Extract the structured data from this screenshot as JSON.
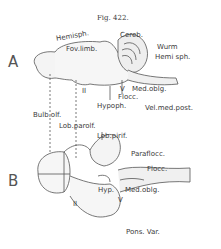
{
  "figure": {
    "title": "Fig. 422.",
    "panels": [
      {
        "letter": "A",
        "labels": {
          "hemisph": "Hemisph.",
          "cereb": "Cereb.",
          "wurm": "Wurm",
          "hemisph_cereb": "Hemi sph.",
          "fov_limb": "Fov.limb.",
          "roman_two": "II",
          "roman_five": "V",
          "med_oblg": "Med.oblg.",
          "flocc": "Flocc.",
          "hypoph": "Hypoph.",
          "vel_med_post": "Vel.med.post."
        }
      },
      {
        "letter": "B",
        "labels": {
          "bulb_olf": "Bulb.olf.",
          "lob_parolf": "Lob.parolf.",
          "lob_pirif": "Lob.pirif.",
          "paraflocc": "Paraflocc.",
          "flocc": "Flocc.",
          "hyp": "Hyp.",
          "med_oblg": "Med.oblg.",
          "roman_two": "II",
          "roman_five": "V",
          "pons_var": "Pons. Var."
        }
      }
    ]
  }
}
